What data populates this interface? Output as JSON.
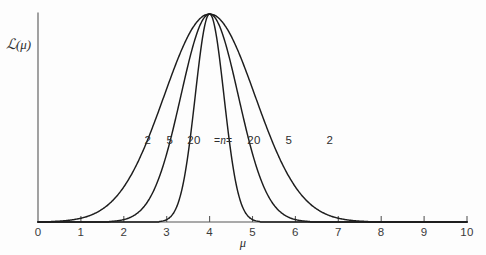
{
  "figure": {
    "background_color": "#fdfdfd",
    "ink_color": "#1d1d1d",
    "axis_color": "#565656"
  },
  "axes": {
    "y_label": "ℒ(μ)",
    "y_label_script": "ℒ",
    "y_label_arg": "(μ)",
    "x_label": "μ",
    "x_ticks": [
      "0",
      "1",
      "2",
      "3",
      "4",
      "5",
      "6",
      "7",
      "8",
      "9",
      "10"
    ],
    "x_min": 0,
    "x_max": 10,
    "y_min": 0,
    "y_max": 1
  },
  "annotations": {
    "n_marker": "=n=",
    "n_marker_eq_left": "=",
    "n_marker_n": "n",
    "n_marker_eq_right": "=",
    "left_labels": [
      "2",
      "5",
      "20"
    ],
    "right_labels": [
      "20",
      "5",
      "2"
    ]
  },
  "chart_data": {
    "type": "line",
    "title": "",
    "subtitle": "",
    "xlabel": "μ",
    "ylabel": "ℒ(μ)",
    "xlim": [
      0,
      10
    ],
    "ylim": [
      0,
      1
    ],
    "grid": false,
    "legend_position": "inline-curve-labels",
    "xticks": [
      0,
      1,
      2,
      3,
      4,
      5,
      6,
      7,
      8,
      9,
      10
    ],
    "yticks": [],
    "peak_x": 4,
    "peak_y": 1,
    "series": [
      {
        "name": "n = 2",
        "n": 2,
        "sigma": 1.06,
        "color": "#1d1d1d",
        "x": [
          0.6,
          1.0,
          1.4,
          1.8,
          2.2,
          2.6,
          3.0,
          3.4,
          3.8,
          4.0,
          4.2,
          4.6,
          5.0,
          5.4,
          5.8,
          6.2,
          6.6,
          7.0,
          7.4,
          7.8,
          8.2,
          8.6,
          9.0,
          9.4,
          10.0
        ],
        "y": [
          0.004,
          0.011,
          0.028,
          0.064,
          0.131,
          0.242,
          0.403,
          0.604,
          0.843,
          0.96,
          0.984,
          0.883,
          0.659,
          0.425,
          0.243,
          0.124,
          0.057,
          0.024,
          0.009,
          0.004,
          0.002,
          0.001,
          0.001,
          0.0,
          0.0
        ]
      },
      {
        "name": "n = 5",
        "n": 5,
        "sigma": 0.67,
        "color": "#1d1d1d",
        "x": [
          1.4,
          1.8,
          2.2,
          2.6,
          3.0,
          3.2,
          3.4,
          3.6,
          3.8,
          4.0,
          4.2,
          4.4,
          4.6,
          4.8,
          5.0,
          5.2,
          5.4,
          5.8,
          6.2,
          6.6,
          7.0,
          7.4,
          8.0
        ],
        "y": [
          0.001,
          0.004,
          0.017,
          0.062,
          0.189,
          0.302,
          0.444,
          0.599,
          0.759,
          0.9,
          0.988,
          0.995,
          0.908,
          0.755,
          0.575,
          0.397,
          0.25,
          0.082,
          0.02,
          0.004,
          0.001,
          0.0,
          0.0
        ]
      },
      {
        "name": "n = 20",
        "n": 20,
        "sigma": 0.335,
        "color": "#1d1d1d",
        "x": [
          2.6,
          2.8,
          3.0,
          3.1,
          3.2,
          3.3,
          3.4,
          3.5,
          3.6,
          3.7,
          3.8,
          3.9,
          4.0,
          4.1,
          4.2,
          4.3,
          4.4,
          4.5,
          4.6,
          4.7,
          4.8,
          4.9,
          5.0,
          5.2,
          5.4,
          5.6,
          6.0
        ],
        "y": [
          0.0,
          0.001,
          0.008,
          0.021,
          0.051,
          0.11,
          0.214,
          0.372,
          0.578,
          0.8,
          0.964,
          1.0,
          0.999,
          0.964,
          0.8,
          0.578,
          0.372,
          0.214,
          0.11,
          0.051,
          0.021,
          0.008,
          0.003,
          0.0,
          0.0,
          0.0,
          0.0
        ]
      }
    ]
  },
  "geometry": {
    "plot_left": 38,
    "plot_right": 467,
    "baseline_y": 222,
    "top_y": 14,
    "axis_top_y": 13,
    "tick_len": 6,
    "label_row_y": 134
  }
}
